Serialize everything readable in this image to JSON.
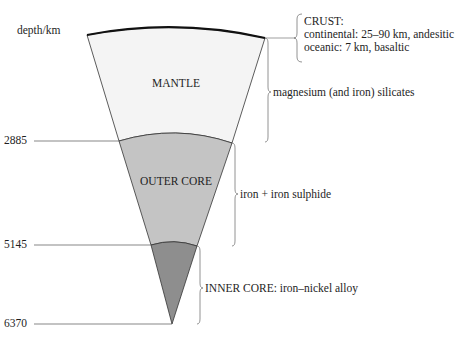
{
  "diagram": {
    "axis_label": "depth/km",
    "depth_ticks": [
      {
        "value": "2885"
      },
      {
        "value": "5145"
      },
      {
        "value": "6370"
      }
    ],
    "layers": [
      {
        "name": "MANTLE",
        "fill": "#f4f4f4",
        "composition": "magnesium (and iron) silicates"
      },
      {
        "name": "OUTER CORE",
        "fill": "#c4c4c4",
        "composition": "iron + iron sulphide"
      },
      {
        "name": "INNER CORE",
        "fill": "#8e8e8e",
        "composition": "INNER CORE: iron–nickel alloy"
      }
    ],
    "crust": {
      "title": "CRUST:",
      "line1": "continental: 25–90 km, andesitic",
      "line2": "oceanic: 7 km, basaltic"
    }
  }
}
